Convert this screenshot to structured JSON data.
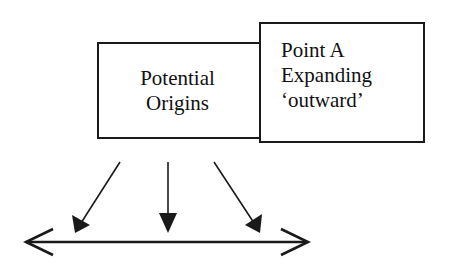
{
  "diagram": {
    "left_box": {
      "lines": [
        "Potential",
        "Origins"
      ]
    },
    "right_box": {
      "lines": [
        "Point A",
        "Expanding",
        "‘outward’"
      ]
    },
    "arrows": {
      "down_arrows": [
        {
          "from": [
            120,
            162
          ],
          "to": [
            75,
            232
          ],
          "direction": "down-left"
        },
        {
          "from": [
            168,
            162
          ],
          "to": [
            168,
            233
          ],
          "direction": "down"
        },
        {
          "from": [
            214,
            162
          ],
          "to": [
            260,
            232
          ],
          "direction": "down-right"
        }
      ],
      "baseline": {
        "from": [
          25,
          242
        ],
        "to": [
          308,
          242
        ],
        "style": "double-headed"
      }
    },
    "colors": {
      "stroke": "#1a1a1a",
      "background": "#ffffff",
      "text": "#111111"
    }
  }
}
